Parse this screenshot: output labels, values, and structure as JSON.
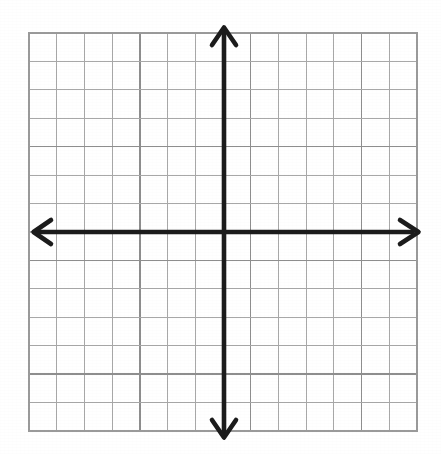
{
  "figure": {
    "background_color": "#ffffff",
    "axis_color": "#1c1c1c",
    "gridline_color": "#a8a8a8",
    "gridline_major_color": "#8e8e8e",
    "border_color": "#9a9a9a"
  },
  "chart_data": {
    "type": "scatter",
    "title": "",
    "subtitle": "",
    "xlabel": "",
    "ylabel": "",
    "x": [],
    "y": [],
    "series": [],
    "annotations": [],
    "legend": [],
    "legend_position": "none",
    "grid": true,
    "xlim": [
      -7,
      7
    ],
    "ylim": [
      -7,
      7
    ],
    "xticks": [
      -7,
      -6,
      -5,
      -4,
      -3,
      -2,
      -1,
      0,
      1,
      2,
      3,
      4,
      5,
      6,
      7
    ],
    "yticks": [
      -7,
      -6,
      -5,
      -4,
      -3,
      -2,
      -1,
      0,
      1,
      2,
      3,
      4,
      5,
      6,
      7
    ],
    "xtick_labels": [],
    "ytick_labels": [],
    "columns": 14,
    "rows": 14,
    "cell_size_px": 27.7,
    "origin_px": {
      "x": 224,
      "y": 232
    },
    "plot_area_px": {
      "left": 29,
      "top": 33,
      "right": 417,
      "bottom": 431
    },
    "axes": {
      "x_axis": {
        "name": "x-axis",
        "arrowheads": [
          "left",
          "right"
        ],
        "start_px": {
          "x": 32,
          "y": 232
        },
        "end_px": {
          "x": 420,
          "y": 232
        }
      },
      "y_axis": {
        "name": "y-axis",
        "arrowheads": [
          "up",
          "down"
        ],
        "start_px": {
          "x": 224,
          "y": 26
        },
        "end_px": {
          "x": 224,
          "y": 439
        }
      }
    }
  },
  "arrows": {
    "up_label": "up-arrowhead",
    "down_label": "down-arrowhead",
    "left_label": "left-arrowhead",
    "right_label": "right-arrowhead"
  }
}
